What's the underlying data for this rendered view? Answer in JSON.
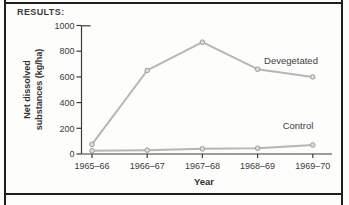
{
  "panel": {
    "heading": "RESULTS:"
  },
  "chart_data": {
    "type": "line",
    "title": "",
    "xlabel": "Year",
    "ylabel": "Net dissolved substances (kg/ha)",
    "ylabel_lines": [
      "Net dissolved",
      "substances (kg/ha)"
    ],
    "categories": [
      "1965–66",
      "1966–67",
      "1967–68",
      "1968–69",
      "1969–70"
    ],
    "y_ticks": [
      0,
      200,
      400,
      600,
      800,
      1000
    ],
    "ylim": [
      0,
      1000
    ],
    "grid": false,
    "legend_position": "inline-labels",
    "series": [
      {
        "name": "Devegetated",
        "values": [
          75,
          650,
          870,
          660,
          600
        ]
      },
      {
        "name": "Control",
        "values": [
          25,
          30,
          40,
          45,
          70
        ]
      }
    ],
    "colors": {
      "line": "#b6b6b6",
      "marker_fill": "#dcdcdc",
      "marker_stroke": "#9b9b9b",
      "axis": "#3d3d3d",
      "tick_text": "#3b3b3b",
      "series_text": "#404040",
      "frame": "#1e1e1e",
      "background": "#fdfdfb"
    }
  }
}
